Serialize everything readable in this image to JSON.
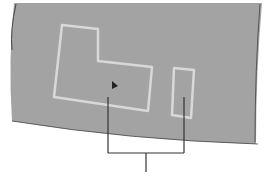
{
  "screen": {
    "background": "#a3a3a3",
    "border_color": "#555555",
    "outline_color": "#d8d8d8",
    "pointer_color": "#222222"
  },
  "regions": [
    {
      "name": "l-shaped-region",
      "shape": "polygon"
    },
    {
      "name": "narrow-rect-region",
      "shape": "rect"
    }
  ],
  "callout": {
    "line_color": "#333333"
  }
}
